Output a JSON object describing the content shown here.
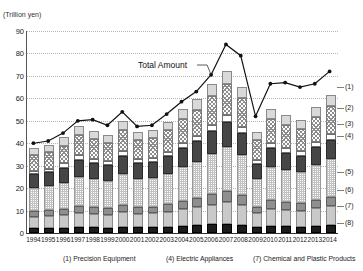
{
  "axis": {
    "unit_label": "(Trillion yen)",
    "y_ticks": [
      0,
      10,
      20,
      30,
      40,
      50,
      60,
      70,
      80,
      90
    ],
    "y_min": 0,
    "y_max": 90
  },
  "annotation": {
    "total_amount_label": "Total Amount"
  },
  "right_labels": [
    {
      "key": "(1)",
      "y_value": 65.0
    },
    {
      "key": "(2)",
      "y_value": 55.5
    },
    {
      "key": "(3)",
      "y_value": 48.5
    },
    {
      "key": "(4)",
      "y_value": 43.0
    },
    {
      "key": "(5)",
      "y_value": 27.0
    },
    {
      "key": "(6)",
      "y_value": 19.0
    },
    {
      "key": "(7)",
      "y_value": 12.0
    },
    {
      "key": "(8)",
      "y_value": 4.5
    }
  ],
  "footer_legend": [
    "(1) Precision Equipment",
    "(4) Electric Appliances",
    "(7) Chemical and Plastic Products"
  ],
  "chart_data": {
    "type": "bar",
    "title": "",
    "subtitle": "",
    "xlabel": "",
    "ylabel": "(Trillion yen)",
    "ylim": [
      0,
      90
    ],
    "grid": true,
    "stacked": true,
    "legend_position": "right-callouts",
    "categories": [
      "1994",
      "1995",
      "1996",
      "1997",
      "1998",
      "1999",
      "2000",
      "2001",
      "2002",
      "2003",
      "2004",
      "2005",
      "2006",
      "2007",
      "2008",
      "2009",
      "2010",
      "2011",
      "2012",
      "2013",
      "2014"
    ],
    "series": [
      {
        "name": "(1) Precision Equipment",
        "key": "(1)",
        "values": [
          3.2,
          3.3,
          3.6,
          4.0,
          3.7,
          3.5,
          4.0,
          3.6,
          3.6,
          3.9,
          4.4,
          4.7,
          5.3,
          5.7,
          5.1,
          3.8,
          4.4,
          4.2,
          4.0,
          4.5,
          5.0
        ]
      },
      {
        "name": "(2)",
        "key": "(2)",
        "values": [
          7.0,
          7.2,
          8.0,
          9.2,
          8.7,
          8.3,
          9.5,
          8.6,
          8.8,
          9.6,
          10.8,
          11.6,
          13.0,
          14.2,
          12.7,
          8.6,
          10.7,
          10.2,
          9.8,
          11.0,
          12.2
        ]
      },
      {
        "name": "(3)",
        "key": "(3)",
        "values": [
          1.6,
          1.6,
          1.8,
          2.0,
          1.9,
          1.8,
          2.1,
          1.9,
          1.9,
          2.1,
          2.3,
          2.5,
          2.8,
          3.1,
          2.8,
          2.0,
          2.3,
          2.2,
          2.1,
          2.4,
          2.6
        ]
      },
      {
        "name": "(4) Electric Appliances",
        "key": "(4)",
        "values": [
          6.0,
          6.2,
          6.7,
          7.6,
          7.2,
          7.0,
          8.1,
          7.1,
          7.2,
          7.8,
          8.6,
          9.1,
          10.1,
          11.0,
          9.8,
          6.7,
          8.3,
          7.7,
          7.2,
          8.0,
          8.6
        ]
      },
      {
        "name": "(5)",
        "key": "(5)",
        "values": [
          10.5,
          10.8,
          11.6,
          13.0,
          12.4,
          12.0,
          13.6,
          12.3,
          12.5,
          13.5,
          15.0,
          16.2,
          18.0,
          19.6,
          17.8,
          12.2,
          15.0,
          14.3,
          13.8,
          15.4,
          16.8
        ]
      },
      {
        "name": "(6)",
        "key": "(6)",
        "values": [
          2.6,
          2.7,
          2.9,
          3.2,
          3.1,
          3.0,
          3.4,
          3.1,
          3.1,
          3.4,
          3.8,
          4.1,
          4.5,
          4.9,
          4.5,
          3.1,
          3.8,
          3.6,
          3.5,
          3.9,
          4.2
        ]
      },
      {
        "name": "(7) Chemical and Plastic Products",
        "key": "(7)",
        "values": [
          5.0,
          5.2,
          5.6,
          6.2,
          5.9,
          5.8,
          6.5,
          6.0,
          6.1,
          6.6,
          7.4,
          8.0,
          8.9,
          9.7,
          8.8,
          6.1,
          7.5,
          7.2,
          6.9,
          7.7,
          8.4
        ]
      },
      {
        "name": "(8)",
        "key": "(8)",
        "values": [
          2.1,
          2.2,
          2.4,
          2.6,
          2.5,
          2.4,
          2.8,
          2.5,
          2.6,
          2.8,
          3.1,
          3.4,
          3.8,
          4.1,
          3.7,
          2.6,
          3.2,
          3.0,
          2.9,
          3.3,
          3.6
        ]
      }
    ],
    "line_series": {
      "name": "Total Amount",
      "values": [
        40.0,
        41.0,
        44.5,
        50.0,
        50.5,
        48.0,
        54.0,
        47.5,
        48.0,
        53.0,
        58.5,
        63.0,
        70.5,
        84.0,
        79.0,
        52.0,
        66.5,
        67.0,
        65.0,
        66.5,
        72.0
      ]
    }
  }
}
